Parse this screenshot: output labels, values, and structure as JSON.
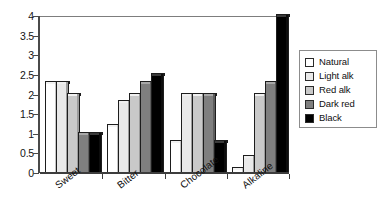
{
  "chart_data": {
    "type": "bar",
    "title": "",
    "subtitle": "",
    "xlabel": "",
    "ylabel": "",
    "ylim": [
      0,
      4
    ],
    "ytick_labels": [
      "4",
      "3.5",
      "3",
      "2.5",
      "2",
      "1.5",
      "1",
      "0.5",
      "0"
    ],
    "ytick_values": [
      4,
      3.5,
      3,
      2.5,
      2,
      1.5,
      1,
      0.5,
      0
    ],
    "grid": false,
    "legend_position": "right",
    "categories": [
      "Sweet",
      "Bitter",
      "Chocolate",
      "Alkaline"
    ],
    "series": [
      {
        "name": "Natural",
        "color": "#ffffff",
        "values": [
          2.3,
          1.2,
          0.8,
          0.1
        ]
      },
      {
        "name": "Light alk",
        "color": "#e9e9e9",
        "values": [
          2.3,
          1.8,
          2.0,
          0.4
        ]
      },
      {
        "name": "Red alk",
        "color": "#c9c9c9",
        "values": [
          2.0,
          2.0,
          2.0,
          2.0
        ]
      },
      {
        "name": "Dark red",
        "color": "#7f7f7f",
        "values": [
          1.0,
          2.3,
          2.0,
          2.3
        ]
      },
      {
        "name": "Black",
        "color": "#000000",
        "values": [
          1.0,
          2.5,
          0.8,
          4.0
        ]
      }
    ]
  },
  "legend": {
    "items": [
      {
        "label": "Natural",
        "color": "#ffffff"
      },
      {
        "label": "Light alk",
        "color": "#e9e9e9"
      },
      {
        "label": "Red alk",
        "color": "#c9c9c9"
      },
      {
        "label": "Dark red",
        "color": "#7f7f7f"
      },
      {
        "label": "Black",
        "color": "#000000"
      }
    ]
  },
  "axes": {
    "y_ticks": [
      "4",
      "3.5",
      "3",
      "2.5",
      "2",
      "1.5",
      "1",
      "0.5",
      "0"
    ],
    "x_categories": [
      "Sweet",
      "Bitter",
      "Chocolate",
      "Alkaline"
    ]
  }
}
